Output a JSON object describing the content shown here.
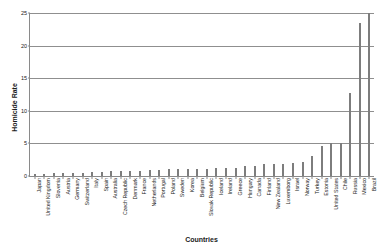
{
  "chart_data": {
    "type": "bar",
    "title": "",
    "xlabel": "Countries",
    "ylabel": "Homicide Rate",
    "ylim": [
      0,
      25
    ],
    "yticks": [
      0,
      5,
      10,
      15,
      20,
      25
    ],
    "grid": true,
    "legend": "none",
    "bar_color": "#7d7d7d",
    "categories": [
      "Japan",
      "United Kingdom",
      "Slovenia",
      "Austria",
      "Germany",
      "Switzerland",
      "Italy",
      "Spain",
      "Australia",
      "Czech Republic",
      "Denmark",
      "France",
      "Netherlands",
      "Portugal",
      "Poland",
      "Sweden",
      "Korea",
      "Belgium",
      "Slovak Republic",
      "Iceland",
      "Ireland",
      "Greece",
      "Hungary",
      "Canada",
      "Finland",
      "New Zealand",
      "Luxemborg",
      "Israel",
      "Norway",
      "Turkey",
      "Estonia",
      "United States",
      "Chile",
      "Russia",
      "Mexico",
      "Brazil"
    ],
    "values": [
      0.3,
      0.3,
      0.4,
      0.5,
      0.5,
      0.5,
      0.6,
      0.6,
      0.7,
      0.8,
      0.8,
      0.8,
      0.9,
      0.9,
      1.0,
      1.0,
      1.0,
      1.1,
      1.1,
      1.2,
      1.2,
      1.3,
      1.5,
      1.6,
      1.8,
      1.8,
      1.9,
      2.0,
      2.1,
      3.0,
      4.6,
      5.0,
      5.0,
      12.7,
      23.4,
      25.0
    ]
  }
}
